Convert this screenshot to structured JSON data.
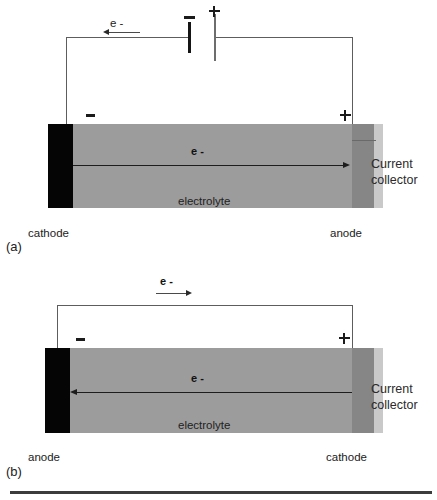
{
  "figure": {
    "type": "diagram",
    "colors": {
      "electrolyte": "#9c9c9c",
      "electrode_dark": "#050505",
      "collector_dark": "#868686",
      "collector_light": "#c9c9c9",
      "wire": "#5d5d5d",
      "text": "#1a1a1a",
      "bottom_rule": "#3c3c3c"
    }
  },
  "panel_a": {
    "caption": "(a)",
    "external_electron_label": "e -",
    "external_arrow_direction": "left",
    "battery": {
      "negative_sign": "−",
      "positive_sign": "+"
    },
    "terminal_left_sign": "−",
    "terminal_right_sign": "+",
    "internal_electron_label": "e -",
    "internal_arrow_direction": "right",
    "electrolyte_label": "electrolyte",
    "left_electrode_label": "cathode",
    "right_electrode_label": "anode",
    "current_collector_label_line1": "Current",
    "current_collector_label_line2": "collector"
  },
  "panel_b": {
    "caption": "(b)",
    "external_electron_label": "e -",
    "external_arrow_direction": "right",
    "terminal_left_sign": "−",
    "terminal_right_sign": "+",
    "internal_electron_label": "e -",
    "internal_arrow_direction": "left",
    "electrolyte_label": "electrolyte",
    "left_electrode_label": "anode",
    "right_electrode_label": "cathode",
    "current_collector_label_line1": "Current",
    "current_collector_label_line2": "collector"
  }
}
